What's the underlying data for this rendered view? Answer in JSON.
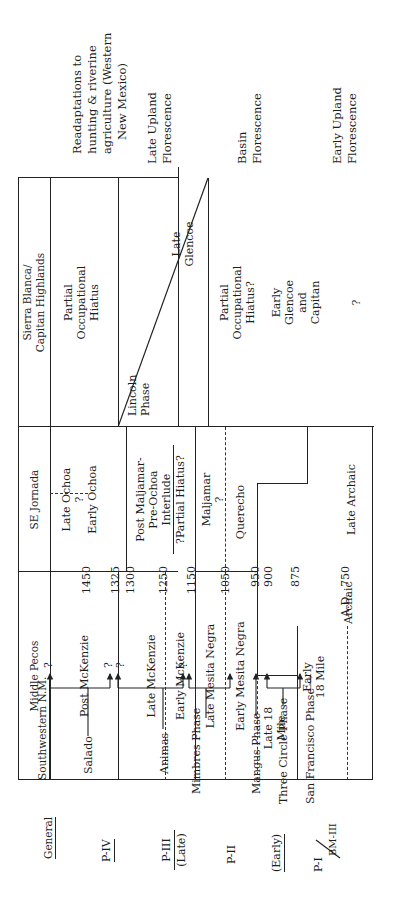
{
  "general": {
    "header": "General",
    "periods": [
      "P-IV",
      "P-III",
      "(Late)",
      "P-II",
      "(Early)",
      "P-I",
      "BM-III"
    ]
  },
  "southwestern_nm": {
    "header": "Southwestern N.M.",
    "phases": [
      "Salado",
      "Animas",
      "Mimbres Phase",
      "Mangus Phase",
      "Three Circle Phase",
      "San Francisco Phase →"
    ],
    "question": "?"
  },
  "dates": {
    "prefix": "A.D.",
    "values": [
      "1450",
      "1325",
      "1300",
      "1250",
      "1150",
      "1050",
      "950",
      "900",
      "875",
      "750"
    ]
  },
  "table": {
    "headers": {
      "middle_pecos": "Middle Pecos",
      "se_jornada": "SE Jornada",
      "sierra_blanca_1": "Sierra Blanca/",
      "sierra_blanca_2": "Capitan Highlands"
    },
    "middle_pecos": {
      "post_mckenzie": "Post McKenzie",
      "late_mckenzie": "Late McKenzie",
      "early_mckenzie": "Early McKenzie",
      "late_mesita": "Late Mesita Negra",
      "early_mesita": "Early Mesita Negra",
      "late18_1": "Late 18",
      "late18_2": "Mile",
      "early18_1": "Early",
      "early18_2": "18 Mile",
      "archaic": "Archaic"
    },
    "se_jornada": {
      "late_ochoa": "Late Ochoa",
      "q1": "?",
      "early_ochoa": "Early Ochoa",
      "post_1": "Post Maljamar-",
      "post_2": "Pre-Ochoa",
      "post_3": "Interlude",
      "partial_hiatus": "?Partial Hiatus?",
      "maljamar": "Maljamar",
      "q2": "?",
      "querecho": "Querecho",
      "late_archaic": "Late Archaic"
    },
    "sierra_blanca": {
      "hiatus1_1": "Partial",
      "hiatus1_2": "Occupational",
      "hiatus1_3": "Hiatus",
      "lincoln_1": "Lincoln",
      "lincoln_2": "Phase",
      "late_glencoe_1": "Late",
      "late_glencoe_2": "Glencoe",
      "hiatus2_1": "Partial",
      "hiatus2_2": "Occupational",
      "hiatus2_3": "Hiatus?",
      "early_glencoe_1": "Early",
      "early_glencoe_2": "Glencoe",
      "early_glencoe_3": "and",
      "early_glencoe_4": "Capitan",
      "q3": "?"
    }
  },
  "interpretations": [
    {
      "lines": [
        "Readaptations to",
        "hunting & riverine",
        "agriculture (Western",
        "New Mexico)"
      ]
    },
    {
      "lines": [
        "Late Upland",
        "Florescence"
      ]
    },
    {
      "lines": [
        "Basin",
        "Florescence"
      ]
    },
    {
      "lines": [
        "Early Upland",
        "Florescence"
      ]
    }
  ]
}
